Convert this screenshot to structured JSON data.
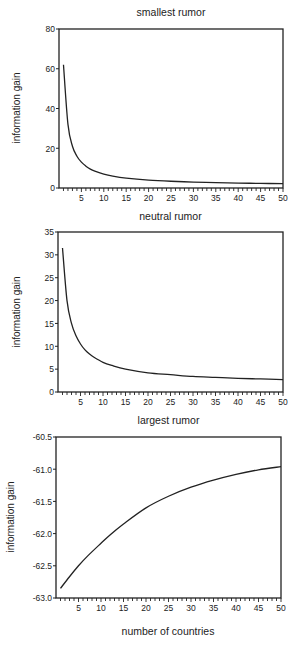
{
  "figure": {
    "shared_xlabel": "number of countries"
  },
  "chart_data": [
    {
      "type": "line",
      "title": "smallest rumor",
      "xlabel": "number of countries",
      "ylabel": "information gain",
      "xlim": [
        0,
        50
      ],
      "ylim": [
        0,
        80
      ],
      "xticks": [
        5,
        10,
        15,
        20,
        25,
        30,
        35,
        40,
        45,
        50
      ],
      "yticks": [
        0,
        20,
        40,
        60,
        80
      ],
      "grid": false,
      "legend": null,
      "series": [
        {
          "name": "smallest rumor",
          "x": [
            1,
            2,
            3,
            4,
            5,
            6,
            7,
            8,
            10,
            12,
            15,
            20,
            25,
            30,
            35,
            40,
            45,
            50
          ],
          "values": [
            62,
            32,
            21,
            16,
            13,
            11,
            9.5,
            8.5,
            7,
            6,
            5,
            4,
            3.4,
            3,
            2.7,
            2.5,
            2.3,
            2.2
          ]
        }
      ]
    },
    {
      "type": "line",
      "title": "neutral rumor",
      "xlabel": "number of countries",
      "ylabel": "information gain",
      "xlim": [
        0,
        50
      ],
      "ylim": [
        0,
        35
      ],
      "xticks": [
        5,
        10,
        15,
        20,
        25,
        30,
        35,
        40,
        45,
        50
      ],
      "yticks": [
        0,
        5,
        10,
        15,
        20,
        25,
        30,
        35
      ],
      "grid": false,
      "legend": null,
      "series": [
        {
          "name": "neutral rumor",
          "x": [
            1,
            2,
            3,
            4,
            5,
            6,
            7,
            8,
            10,
            12,
            15,
            20,
            25,
            30,
            35,
            40,
            45,
            50
          ],
          "values": [
            31.5,
            20,
            15,
            12.3,
            10.5,
            9.2,
            8.3,
            7.6,
            6.5,
            5.8,
            5,
            4.2,
            3.8,
            3.4,
            3.2,
            3,
            2.85,
            2.7
          ]
        }
      ]
    },
    {
      "type": "line",
      "title": "largest rumor",
      "xlabel": "number of countries",
      "ylabel": "information gain",
      "xlim": [
        0,
        50
      ],
      "ylim": [
        -63.0,
        -60.5
      ],
      "xticks": [
        5,
        10,
        15,
        20,
        25,
        30,
        35,
        40,
        45,
        50
      ],
      "yticks": [
        -63.0,
        -62.5,
        -62.0,
        -61.5,
        -61.0,
        -60.5
      ],
      "grid": false,
      "legend": null,
      "series": [
        {
          "name": "largest rumor",
          "x": [
            1,
            3,
            5,
            7,
            10,
            12,
            15,
            20,
            25,
            30,
            35,
            40,
            45,
            50
          ],
          "values": [
            -62.85,
            -62.67,
            -62.5,
            -62.35,
            -62.15,
            -62.02,
            -61.85,
            -61.6,
            -61.42,
            -61.28,
            -61.17,
            -61.08,
            -61.01,
            -60.96
          ]
        }
      ]
    }
  ],
  "style": {
    "line_color": "#222222",
    "axis_color": "#222222",
    "background": "#ffffff"
  }
}
